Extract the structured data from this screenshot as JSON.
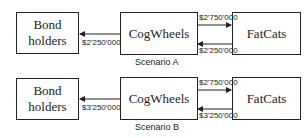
{
  "scenarios": [
    {
      "caption": "Scenario A",
      "nodes": {
        "bondholders": "Bond holders",
        "bondholders_line1": "Bond",
        "bondholders_line2": "holders",
        "cogwheels": "CogWheels",
        "fatcats": "FatCats"
      },
      "flows": {
        "cog_to_bond": "$2'250'000",
        "cog_to_fat": "$2'750'000",
        "fat_to_cog": "$2'250'000"
      }
    },
    {
      "caption": "Scenario B",
      "nodes": {
        "bondholders": "Bond holders",
        "bondholders_line1": "Bond",
        "bondholders_line2": "holders",
        "cogwheels": "CogWheels",
        "fatcats": "FatCats"
      },
      "flows": {
        "cog_to_bond": "$3'250'000",
        "cog_to_fat": "$2'750'000",
        "fat_to_cog": "$3'250'000"
      }
    }
  ]
}
